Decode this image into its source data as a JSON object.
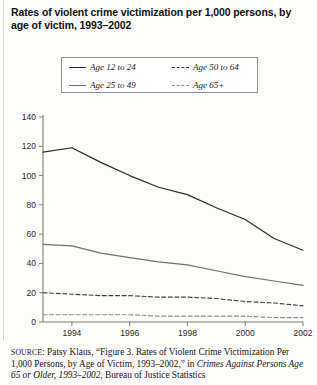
{
  "figure": {
    "title": "Rates of violent crime victimization per 1,000 persons, by age of victim, 1993–2002"
  },
  "legend": {
    "items": [
      {
        "label": "Age 12 to 24",
        "style": "solid",
        "swatch": "s1"
      },
      {
        "label": "Age 25 to 49",
        "style": "solid",
        "swatch": "s2"
      },
      {
        "label": "Age 50 to 64",
        "style": "dashed",
        "swatch": "s3"
      },
      {
        "label": "Age 65+",
        "style": "dashed",
        "swatch": "s4"
      }
    ]
  },
  "source": {
    "label": "SOURCE",
    "line1": ": Patsy Klaus, “Figure 3. Rates of Violent Crime Victimization",
    "line2_a": "Per 1,000 Persons, by Age of Victim, 1993–2002,” in ",
    "line2_b": "Crimes Against",
    "line3_a": "Persons Age 65 or Older, 1993–2002",
    "line3_b": ", Bureau of Justice Statistics"
  },
  "chart_data": {
    "type": "line",
    "title": "Rates of violent crime victimization per 1,000 persons, by age of victim, 1993–2002",
    "xlabel": "",
    "ylabel": "",
    "x": [
      1993,
      1994,
      1995,
      1996,
      1997,
      1998,
      1999,
      2000,
      2001,
      2002
    ],
    "xlim": [
      1993,
      2002
    ],
    "ylim": [
      0,
      140
    ],
    "yticks": [
      0,
      20,
      40,
      60,
      80,
      100,
      120,
      140
    ],
    "xticks": [
      1994,
      1996,
      1998,
      2000,
      2002
    ],
    "xtick_labels": [
      "1994",
      "1996",
      "1998",
      "2000",
      "2002"
    ],
    "ytick_labels": [
      "0",
      "20",
      "40",
      "60",
      "80",
      "100",
      "120",
      "140"
    ],
    "grid": false,
    "legend_position": "top",
    "series": [
      {
        "name": "Age 12 to 24",
        "style": "solid",
        "color": "#2b2b2b",
        "values": [
          116,
          119,
          109,
          100,
          92,
          87,
          78,
          70,
          57,
          49
        ]
      },
      {
        "name": "Age 25 to 49",
        "style": "solid",
        "color": "#6f6f6f",
        "values": [
          53,
          52,
          47,
          44,
          41,
          39,
          35,
          31,
          28,
          25
        ]
      },
      {
        "name": "Age 50 to 64",
        "style": "dashed",
        "color": "#3f3f3f",
        "values": [
          20,
          19,
          18,
          18,
          17,
          17,
          16,
          14,
          13,
          11
        ]
      },
      {
        "name": "Age 65+",
        "style": "dashed",
        "color": "#8d8d8d",
        "values": [
          5,
          5,
          5,
          5,
          4,
          4,
          4,
          4,
          3,
          3
        ]
      }
    ]
  }
}
